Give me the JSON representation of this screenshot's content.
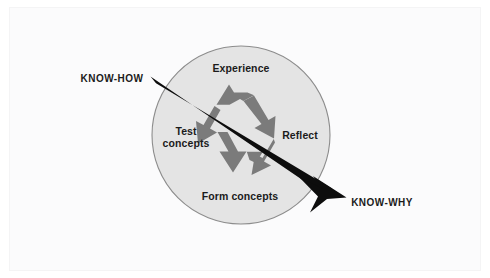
{
  "diagram": {
    "type": "cycle-with-axis-arrow",
    "shape": {
      "name": "circle",
      "fill_color": "#e4e4e4",
      "stroke_color": "#8c8c8c",
      "center_x": 241,
      "center_y": 135,
      "radius": 89
    },
    "center_icon": {
      "name": "recycle-icon",
      "description": "three chasing arrows mobius recycling symbol",
      "color": "#7b7b7b"
    },
    "cycle_labels": [
      {
        "id": "experience",
        "text": "Experience",
        "position": "top"
      },
      {
        "id": "reflect",
        "text": "Reflect",
        "position": "right"
      },
      {
        "id": "form-concepts",
        "text": "Form concepts",
        "position": "bottom"
      },
      {
        "id": "test-concepts",
        "text": "Test\nconcepts",
        "line1": "Test",
        "line2": "concepts",
        "position": "left"
      }
    ],
    "axis_arrow": {
      "name": "know-how-to-know-why-arrow",
      "color": "#0d0d0d",
      "start_label": "KNOW-HOW",
      "end_label": "KNOW-WHY",
      "start_x": 152,
      "start_y": 80,
      "end_x": 346,
      "end_y": 197
    },
    "colors": {
      "background": "#ffffff",
      "page_panel": "#fbfbfc",
      "circle_fill": "#e4e4e4",
      "circle_stroke": "#8c8c8c",
      "recycle_gray": "#7b7b7b",
      "arrow_black": "#0d0d0d",
      "text": "#1b1b1b"
    }
  }
}
